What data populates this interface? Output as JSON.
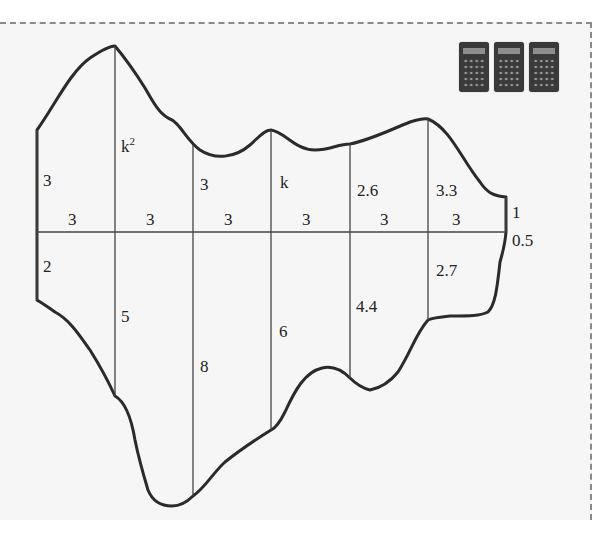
{
  "diagram": {
    "strip_widths": [
      "3",
      "3",
      "3",
      "3",
      "3",
      "3"
    ],
    "upper_offsets": [
      "3",
      "k²",
      "3",
      "k",
      "2.6",
      "3.3",
      "1"
    ],
    "lower_offsets": [
      "2",
      "5",
      "8",
      "6",
      "4.4",
      "2.7",
      "0.5"
    ],
    "labels": {
      "u0": "3",
      "u1_base": "k",
      "u1_sup": "2",
      "u2": "3",
      "u3": "k",
      "u4": "2.6",
      "u5": "3.3",
      "u6": "1",
      "l0": "2",
      "l1": "5",
      "l2": "8",
      "l3": "6",
      "l4": "4.4",
      "l5": "2.7",
      "l6": "0.5",
      "w0": "3",
      "w1": "3",
      "w2": "3",
      "w3": "3",
      "w4": "3",
      "w5": "3"
    }
  },
  "toolbar": {
    "calculators": [
      {
        "icon": "calculator-icon"
      },
      {
        "icon": "calculator-icon"
      },
      {
        "icon": "calculator-icon"
      }
    ]
  },
  "colors": {
    "background": "#f6f6f6",
    "outline": "#2a2a2a",
    "grid": "#444444",
    "border": "#8a8a8a"
  }
}
